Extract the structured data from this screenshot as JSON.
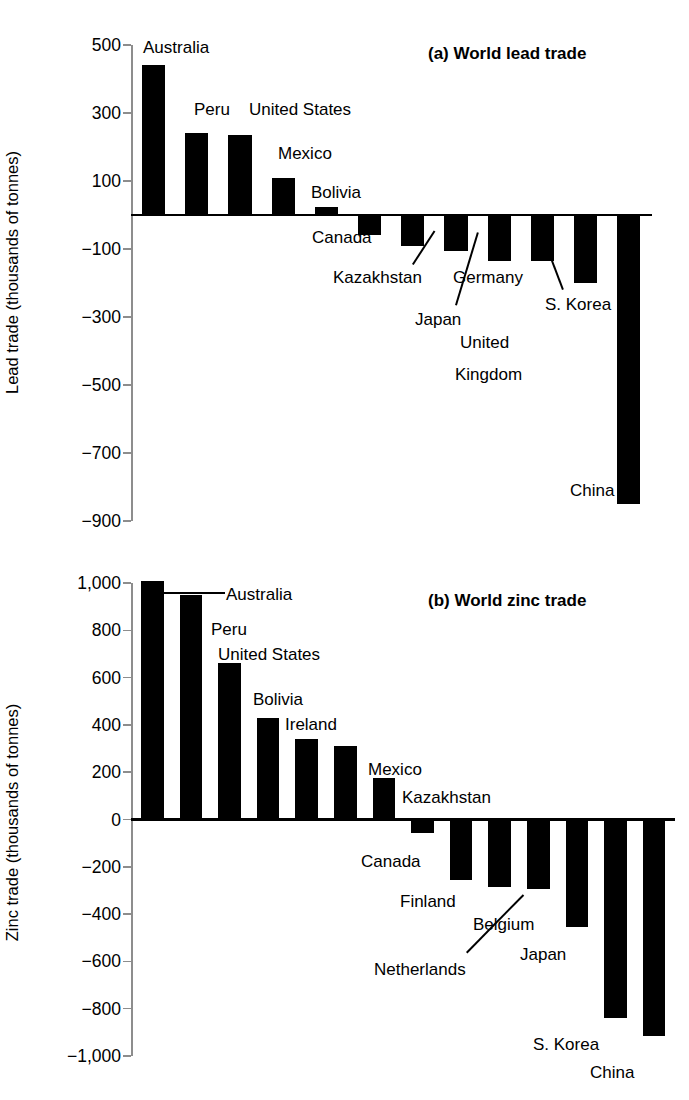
{
  "figure": {
    "panels": [
      {
        "id": "a",
        "title": "(a) World lead trade",
        "ylabel": "Lead trade (thousands of tonnes)"
      },
      {
        "id": "b",
        "title": "(b) World zinc trade",
        "ylabel": "Zinc trade (thousands of tonnes)"
      }
    ]
  },
  "chart_data": [
    {
      "type": "bar",
      "title": "(a) World lead trade",
      "xlabel": "",
      "ylabel": "Lead trade (thousands of tonnes)",
      "ylim": [
        -900,
        500
      ],
      "yticks": [
        500,
        300,
        100,
        -100,
        -300,
        -500,
        -700,
        -900
      ],
      "ytick_labels": [
        "500",
        "300",
        "100",
        "−100",
        "−300",
        "−500",
        "−700",
        "−900"
      ],
      "grid": false,
      "legend": "none",
      "categories": [
        "Australia",
        "Peru",
        "United States",
        "Mexico",
        "Bolivia",
        "Canada",
        "Kazakhstan",
        "Germany",
        "Japan",
        "United Kingdom",
        "S. Korea",
        "China"
      ],
      "values": [
        440,
        240,
        235,
        110,
        25,
        -60,
        -90,
        -105,
        -135,
        -135,
        -200,
        -850
      ]
    },
    {
      "type": "bar",
      "title": "(b) World zinc trade",
      "xlabel": "",
      "ylabel": "Zinc trade (thousands of tonnes)",
      "ylim": [
        -1000,
        1000
      ],
      "yticks": [
        1000,
        800,
        600,
        400,
        200,
        0,
        -200,
        -400,
        -600,
        -800,
        -1000
      ],
      "ytick_labels": [
        "1,000",
        "800",
        "600",
        "400",
        "200",
        "0",
        "−200",
        "−400",
        "−600",
        "−800",
        "−1,000"
      ],
      "grid": false,
      "legend": "none",
      "categories": [
        "Australia",
        "Peru",
        "United States",
        "Bolivia",
        "Ireland",
        "Mexico",
        "Kazakhstan",
        "Canada",
        "Finland",
        "Netherlands",
        "Belgium",
        "Japan",
        "S. Korea",
        "China"
      ],
      "values": [
        1010,
        950,
        660,
        430,
        340,
        310,
        175,
        -55,
        -255,
        -285,
        -295,
        -455,
        -840,
        -915
      ]
    }
  ],
  "panel_a": {
    "title": "(a) World lead trade",
    "ylabel": "Lead trade (thousands of tonnes)",
    "ytick_labels": [
      "500",
      "300",
      "100",
      "−100",
      "−300",
      "−500",
      "−700",
      "−900"
    ],
    "labels": [
      "Australia",
      "Peru",
      "United States",
      "Mexico",
      "Bolivia",
      "Canada",
      "Kazakhstan",
      "Germany",
      "Japan",
      "United",
      "Kingdom",
      "S. Korea",
      "China"
    ]
  },
  "panel_b": {
    "title": "(b) World zinc trade",
    "ylabel": "Zinc trade (thousands of tonnes)",
    "ytick_labels": [
      "1,000",
      "800",
      "600",
      "400",
      "200",
      "0",
      "−200",
      "−400",
      "−600",
      "−800",
      "−1,000"
    ],
    "labels": [
      "Australia",
      "Peru",
      "United States",
      "Bolivia",
      "Ireland",
      "Mexico",
      "Kazakhstan",
      "Canada",
      "Finland",
      "Netherlands",
      "Belgium",
      "Japan",
      "S. Korea",
      "China"
    ]
  }
}
